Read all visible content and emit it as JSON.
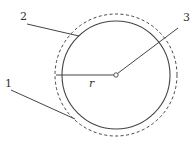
{
  "diagram": {
    "labels": {
      "one": "1",
      "two": "2",
      "three": "3",
      "radius": "r"
    },
    "colors": {
      "stroke": "#444444",
      "background": "#ffffff"
    }
  }
}
